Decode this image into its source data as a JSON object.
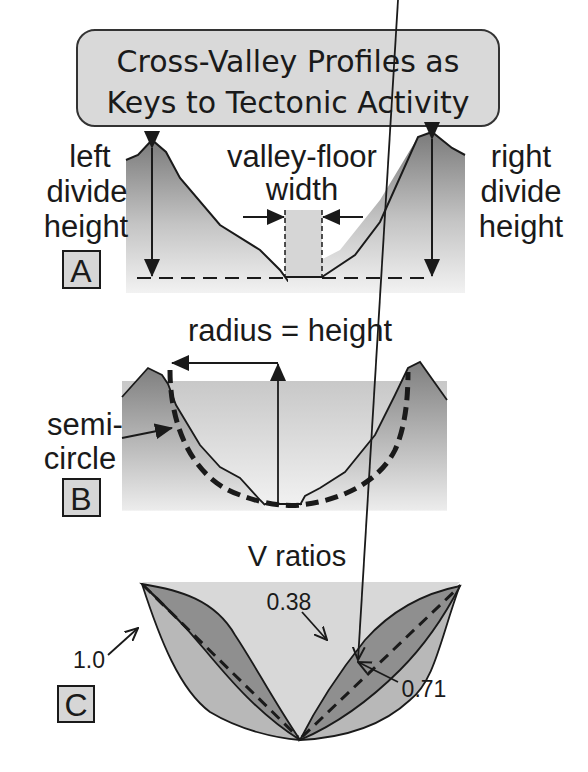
{
  "title": {
    "line1": "Cross-Valley Profiles as",
    "line2": "Keys to Tectonic Activity"
  },
  "panel_a": {
    "letter": "A",
    "left_label": [
      "left",
      "divide",
      "height"
    ],
    "right_label": [
      "right",
      "divide",
      "height"
    ],
    "center_label": [
      "valley-floor",
      "width"
    ]
  },
  "panel_b": {
    "letter": "B",
    "top_label": "radius = height",
    "side_label": [
      "semi-",
      "circle"
    ]
  },
  "panel_c": {
    "letter": "C",
    "title": "V ratios",
    "values": [
      "1.0",
      "0.38",
      "0.71"
    ]
  },
  "colors": {
    "dark_fill": "#8c8c8c",
    "light_fill": "#d9d9d9",
    "mid_fill": "#b5b5b5",
    "stroke": "#1a1a1a",
    "title_box": "#d9d9d9"
  }
}
